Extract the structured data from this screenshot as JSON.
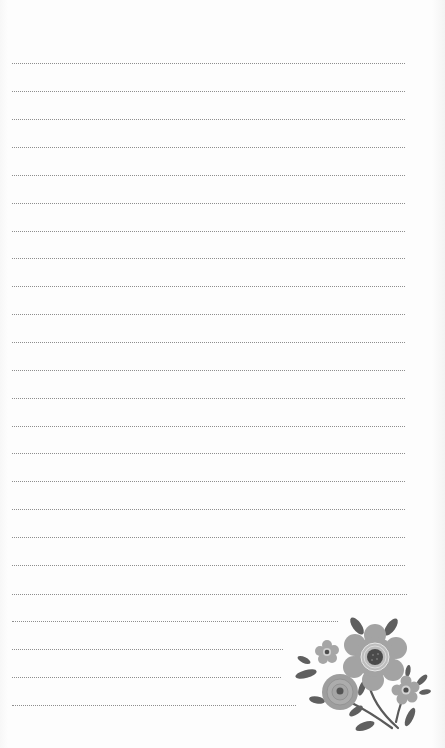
{
  "page": {
    "type": "lined-notepad",
    "background": "#fdfdfd",
    "line_color": "#8e8e8e",
    "line_style": "dotted"
  },
  "lines": [
    {
      "y": 63,
      "x1": 12,
      "x2": 405
    },
    {
      "y": 91,
      "x1": 12,
      "x2": 405
    },
    {
      "y": 119,
      "x1": 12,
      "x2": 405
    },
    {
      "y": 147,
      "x1": 12,
      "x2": 405
    },
    {
      "y": 175,
      "x1": 12,
      "x2": 405
    },
    {
      "y": 203,
      "x1": 12,
      "x2": 405
    },
    {
      "y": 231,
      "x1": 12,
      "x2": 405
    },
    {
      "y": 258,
      "x1": 12,
      "x2": 405
    },
    {
      "y": 286,
      "x1": 12,
      "x2": 405
    },
    {
      "y": 314,
      "x1": 12,
      "x2": 405
    },
    {
      "y": 342,
      "x1": 12,
      "x2": 405
    },
    {
      "y": 370,
      "x1": 12,
      "x2": 405
    },
    {
      "y": 398,
      "x1": 12,
      "x2": 405
    },
    {
      "y": 426,
      "x1": 12,
      "x2": 405
    },
    {
      "y": 453,
      "x1": 12,
      "x2": 405
    },
    {
      "y": 481,
      "x1": 12,
      "x2": 405
    },
    {
      "y": 509,
      "x1": 12,
      "x2": 405
    },
    {
      "y": 537,
      "x1": 12,
      "x2": 405
    },
    {
      "y": 565,
      "x1": 12,
      "x2": 405
    },
    {
      "y": 594,
      "x1": 12,
      "x2": 407
    },
    {
      "y": 621,
      "x1": 12,
      "x2": 338
    },
    {
      "y": 649,
      "x1": 12,
      "x2": 283
    },
    {
      "y": 677,
      "x1": 12,
      "x2": 281
    },
    {
      "y": 705,
      "x1": 12,
      "x2": 296
    }
  ],
  "decoration": {
    "name": "floral-bouquet",
    "petal_color": "#9a9a9a",
    "leaf_color": "#5f5f5f",
    "center_color": "#4a4a4a"
  }
}
